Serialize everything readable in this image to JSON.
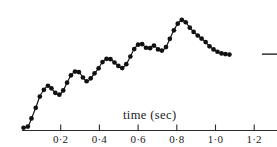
{
  "figure": {
    "background_color": "#ffffff",
    "ink_color": "#111111",
    "axis_color": "#2b2b2b"
  },
  "chart_data": {
    "type": "line",
    "title": "",
    "subtitle": "",
    "xlabel": "time (sec)",
    "ylabel": "",
    "grid": false,
    "legend": null,
    "marker": "filled-circle",
    "xlim": [
      0.0,
      1.32
    ],
    "ylim": [
      0.0,
      1.0
    ],
    "xticks": [
      0.2,
      0.4,
      0.6,
      0.8,
      1.0,
      1.2
    ],
    "xtick_labels": [
      "0·2",
      "0·4",
      "0·6",
      "0·8",
      "1·0",
      "1·2"
    ],
    "yticks": [],
    "ytick_labels": [],
    "x": [
      0.008,
      0.03,
      0.049,
      0.071,
      0.092,
      0.113,
      0.134,
      0.152,
      0.172,
      0.193,
      0.213,
      0.233,
      0.253,
      0.274,
      0.294,
      0.315,
      0.334,
      0.355,
      0.375,
      0.396,
      0.416,
      0.437,
      0.457,
      0.478,
      0.498,
      0.518,
      0.539,
      0.56,
      0.58,
      0.6,
      0.621,
      0.641,
      0.662,
      0.682,
      0.703,
      0.723,
      0.744,
      0.764,
      0.785,
      0.805,
      0.826,
      0.846,
      0.867,
      0.887,
      0.908,
      0.928,
      0.949,
      0.969,
      0.99,
      1.01,
      1.031,
      1.051,
      1.072,
      1.092,
      1.113,
      1.133,
      1.154,
      1.174,
      1.195
    ],
    "y": [
      0.036,
      0.046,
      0.115,
      0.205,
      0.3,
      0.357,
      0.392,
      0.37,
      0.332,
      0.316,
      0.352,
      0.418,
      0.48,
      0.512,
      0.508,
      0.462,
      0.43,
      0.455,
      0.497,
      0.54,
      0.593,
      0.62,
      0.617,
      0.589,
      0.56,
      0.542,
      0.575,
      0.64,
      0.703,
      0.74,
      0.744,
      0.714,
      0.71,
      0.732,
      0.7,
      0.69,
      0.72,
      0.79,
      0.862,
      0.918,
      0.95,
      0.93,
      0.884,
      0.848,
      0.818,
      0.792,
      0.762,
      0.726,
      0.7,
      0.68,
      0.666,
      0.66,
      0.656
    ],
    "reference_line": {
      "label": "",
      "y": 0.66,
      "x_start": 1.24,
      "x_end": 1.33
    },
    "annotations": []
  },
  "axis": {
    "title": "time (sec)"
  }
}
